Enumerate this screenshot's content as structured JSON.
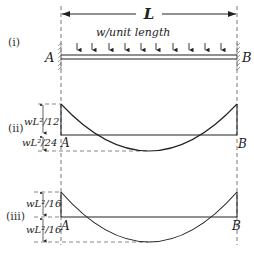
{
  "figure": {
    "span_label": "L",
    "load_label": "w/unit length",
    "support_left": "A",
    "support_right": "B",
    "parts": [
      {
        "id": "i",
        "label": "(i)",
        "description": "Fixed-fixed beam with uniformly distributed load"
      },
      {
        "id": "ii",
        "label": "(ii)",
        "top_value": "wL²/12",
        "bottom_value": "wL²/24",
        "left_label": "A",
        "right_label": "B"
      },
      {
        "id": "iii",
        "label": "(iii)",
        "top_value": "wL²/16",
        "bottom_value": "wL²/16",
        "left_label": "A",
        "right_label": "B"
      }
    ],
    "load_arrow_count": 10,
    "colors": {
      "line": "#222222",
      "dashed": "#555555",
      "hatch": "#777777"
    }
  }
}
